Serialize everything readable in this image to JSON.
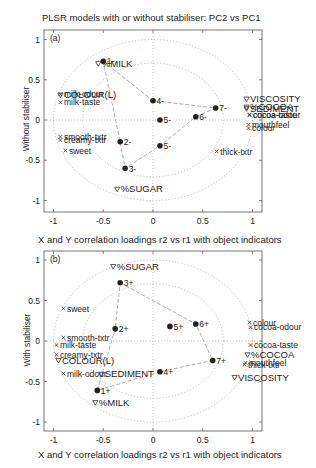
{
  "figure": {
    "title_top": "PLSR models with or without stabiliser: PC2 vs PC1",
    "title_middle": "X and Y correlation loadings r2 vs r1 with object indicators",
    "xlabel_bottom": "X and Y correlation loadings r2 vs r1 with object indicators"
  },
  "chart_data": [
    {
      "type": "scatter",
      "panel": "(a)",
      "title": "PLSR models with or without stabiliser: PC2 vs PC1",
      "xlabel": "",
      "ylabel": "Without stabiliser",
      "xlim": [
        -1.1,
        1.1
      ],
      "ylim": [
        -1.1,
        1.1
      ],
      "xticks": [
        "-1",
        "-0.5",
        "0",
        "0.5",
        "1"
      ],
      "yticks": [
        "1",
        "0.5",
        "0",
        "-0.5",
        "-1"
      ],
      "grid": "dotted zero lines and correlation circles r=0.707 and r=1",
      "circles": [
        0.707,
        1.0
      ],
      "series": [
        {
          "name": "design variables",
          "marker": "triangle-down",
          "points": [
            {
              "label": "%MILK",
              "x": -0.55,
              "y": 0.7
            },
            {
              "label": "COLOUR(L)",
              "x": -0.93,
              "y": 0.31
            },
            {
              "label": "VISCOSITY",
              "x": 0.94,
              "y": 0.26
            },
            {
              "label": "%COCOA",
              "x": 0.94,
              "y": 0.16
            },
            {
              "label": "SEDIMENT",
              "x": 0.94,
              "y": 0.14
            },
            {
              "label": "%SUGAR",
              "x": -0.36,
              "y": -0.86
            }
          ]
        },
        {
          "name": "sensory attributes",
          "marker": "x",
          "points": [
            {
              "label": "milk-odour",
              "x": -0.93,
              "y": 0.32
            },
            {
              "label": "milk-taste",
              "x": -0.93,
              "y": 0.22
            },
            {
              "label": "smooth-txtr",
              "x": -0.93,
              "y": -0.21
            },
            {
              "label": "creamy-txtr",
              "x": -0.93,
              "y": -0.25
            },
            {
              "label": "sweet",
              "x": -0.88,
              "y": -0.38
            },
            {
              "label": "cocoa-taste",
              "x": 0.97,
              "y": 0.07
            },
            {
              "label": "cocoa-odour",
              "x": 0.97,
              "y": 0.06
            },
            {
              "label": "mouthfeel",
              "x": 0.96,
              "y": -0.06
            },
            {
              "label": "colour",
              "x": 0.96,
              "y": -0.1
            },
            {
              "label": "thick-txtr",
              "x": 0.64,
              "y": -0.39
            }
          ]
        },
        {
          "name": "objects",
          "marker": "filled-circle",
          "points": [
            {
              "label": "1-",
              "x": -0.5,
              "y": 0.73
            },
            {
              "label": "4-",
              "x": 0.0,
              "y": 0.24
            },
            {
              "label": "7-",
              "x": 0.63,
              "y": 0.15
            },
            {
              "label": "6-",
              "x": 0.43,
              "y": 0.04
            },
            {
              "label": "5-",
              "x": 0.07,
              "y": 0.0
            },
            {
              "label": "5-",
              "x": 0.07,
              "y": -0.32
            },
            {
              "label": "2-",
              "x": -0.33,
              "y": -0.27
            },
            {
              "label": "3-",
              "x": -0.28,
              "y": -0.6
            }
          ],
          "path_order": [
            "1-",
            "4-",
            "7-",
            "6-",
            "5-b",
            "3-",
            "2-",
            "1-"
          ]
        }
      ]
    },
    {
      "type": "scatter",
      "panel": "(b)",
      "title": "X and Y correlation loadings r2 vs r1 with object indicators",
      "xlabel": "X and Y correlation loadings r2 vs r1 with object indicators",
      "ylabel": "With stabiliser",
      "xlim": [
        -1.1,
        1.1
      ],
      "ylim": [
        -1.1,
        1.1
      ],
      "xticks": [
        "-1",
        "-0.5",
        "0",
        "0.5",
        "1"
      ],
      "yticks": [
        "1",
        "0.5",
        "0",
        "-0.5",
        "-1"
      ],
      "grid": "dotted zero lines and correlation circles r=0.707 and r=1",
      "circles": [
        0.707,
        1.0
      ],
      "series": [
        {
          "name": "design variables",
          "marker": "triangle-down",
          "points": [
            {
              "label": "%SUGAR",
              "x": -0.4,
              "y": 0.92
            },
            {
              "label": "%COCOA",
              "x": 0.95,
              "y": -0.17
            },
            {
              "label": "COLOUR(L)",
              "x": -0.95,
              "y": -0.24
            },
            {
              "label": "SEDIMENT",
              "x": -0.52,
              "y": -0.41
            },
            {
              "label": "VISCOSITY",
              "x": 0.82,
              "y": -0.45
            },
            {
              "label": "%MILK",
              "x": -0.58,
              "y": -0.76
            }
          ]
        },
        {
          "name": "sensory attributes",
          "marker": "x",
          "points": [
            {
              "label": "sweet",
              "x": -0.9,
              "y": 0.4
            },
            {
              "label": "colour",
              "x": 0.97,
              "y": 0.23
            },
            {
              "label": "cocoa-odour",
              "x": 0.98,
              "y": 0.17
            },
            {
              "label": "smooth-txtr",
              "x": -0.9,
              "y": 0.04
            },
            {
              "label": "milk-taste",
              "x": -0.97,
              "y": -0.05
            },
            {
              "label": "cocoa-taste",
              "x": 0.98,
              "y": -0.05
            },
            {
              "label": "creamy-txtr",
              "x": -0.97,
              "y": -0.17
            },
            {
              "label": "mouthfeel",
              "x": 0.93,
              "y": -0.27
            },
            {
              "label": "thick-txtr",
              "x": 0.92,
              "y": -0.29
            },
            {
              "label": "milk-odour",
              "x": -0.9,
              "y": -0.4
            }
          ]
        },
        {
          "name": "objects",
          "marker": "filled-circle",
          "points": [
            {
              "label": "3+",
              "x": -0.33,
              "y": 0.72
            },
            {
              "label": "2+",
              "x": -0.38,
              "y": 0.15
            },
            {
              "label": "5+",
              "x": 0.17,
              "y": 0.18
            },
            {
              "label": "6+",
              "x": 0.43,
              "y": 0.21
            },
            {
              "label": "7+",
              "x": 0.6,
              "y": -0.24
            },
            {
              "label": "4+",
              "x": 0.07,
              "y": -0.38
            },
            {
              "label": "1+",
              "x": -0.56,
              "y": -0.61
            }
          ],
          "path_order": [
            "3+",
            "6+",
            "7+",
            "4+",
            "1+",
            "2+",
            "3+"
          ]
        }
      ]
    }
  ]
}
